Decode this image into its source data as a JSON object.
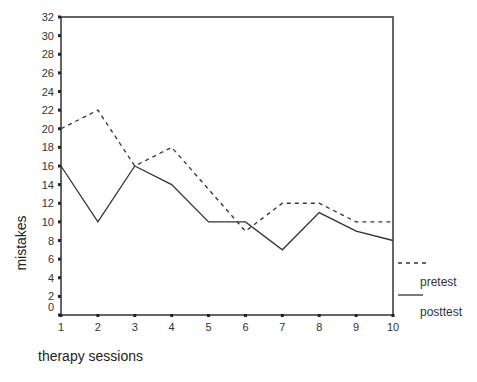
{
  "chart_data": {
    "type": "line",
    "title": "",
    "xlabel": "therapy sessions",
    "ylabel": "mistakes",
    "x": [
      1,
      2,
      3,
      4,
      5,
      6,
      7,
      8,
      9,
      10
    ],
    "xticks": [
      "1",
      "2",
      "3",
      "4",
      "5",
      "6",
      "7",
      "8",
      "9",
      "10"
    ],
    "yticks": [
      "0",
      "2",
      "4",
      "6",
      "8",
      "10",
      "12",
      "14",
      "16",
      "18",
      "20",
      "22",
      "24",
      "26",
      "28",
      "30",
      "32"
    ],
    "ylim": [
      0,
      32
    ],
    "xlim": [
      1,
      10
    ],
    "grid": false,
    "legend_position": "right-bottom",
    "series": [
      {
        "name": "pretest",
        "style": "dashed",
        "color": "#333333",
        "values": [
          20,
          22,
          16,
          18,
          13.5,
          9,
          12,
          12,
          10,
          10
        ]
      },
      {
        "name": "posttest",
        "style": "solid",
        "color": "#333333",
        "values": [
          16,
          10,
          16,
          14,
          10,
          10,
          7,
          11,
          9,
          8
        ]
      }
    ]
  }
}
